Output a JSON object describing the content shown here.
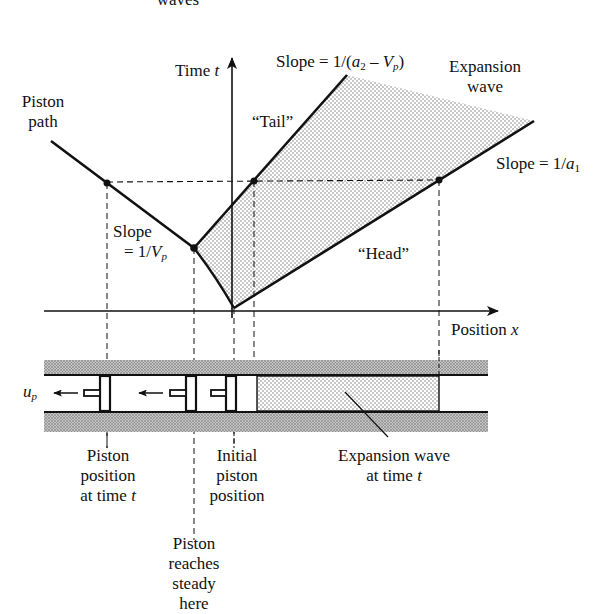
{
  "top_cut_label": "waves",
  "axes": {
    "time_label": "Time",
    "time_var": "t",
    "position_label": "Position",
    "position_var": "x"
  },
  "labels": {
    "piston_path": [
      "Piston",
      "path"
    ],
    "tail": "“Tail”",
    "head": "“Head”",
    "expansion_wave": [
      "Expansion",
      "wave"
    ],
    "slope_tail_prefix": "Slope = 1/(",
    "slope_tail_a": "a",
    "slope_tail_a_sub": "2",
    "slope_tail_mid": " – ",
    "slope_tail_v": "V",
    "slope_tail_v_sub": "p",
    "slope_tail_suffix": ")",
    "slope_head_prefix": "Slope = 1/",
    "slope_head_a": "a",
    "slope_head_a_sub": "1",
    "slope_piston_line1": "Slope",
    "slope_piston_prefix": "= 1/",
    "slope_piston_v": "V",
    "slope_piston_v_sub": "p",
    "up_var": "u",
    "up_sub": "p"
  },
  "callouts": {
    "piston_position": [
      "Piston",
      "position",
      "at time"
    ],
    "piston_position_var": "t",
    "initial_piston": [
      "Initial",
      "piston",
      "position"
    ],
    "steady": [
      "Piston",
      "reaches",
      "steady",
      "here"
    ],
    "expansion_wave_time": [
      "Expansion wave",
      "at time"
    ],
    "expansion_wave_time_var": "t"
  },
  "colors": {
    "ink": "#111111",
    "stipple": "#8a8a8a",
    "wall_hatch": "#9a9a9a"
  }
}
